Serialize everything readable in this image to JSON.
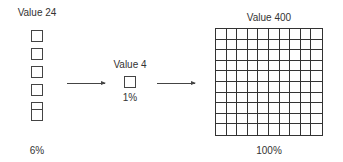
{
  "diagram": {
    "left": {
      "title": "Value 24",
      "percent": "6%",
      "squares": 6
    },
    "middle": {
      "title": "Value 4",
      "percent": "1%",
      "squares": 1
    },
    "right": {
      "title": "Value 400",
      "percent": "100%",
      "grid_rows": 10,
      "grid_cols": 10
    },
    "arrows": [
      {
        "from": "left",
        "to": "middle"
      },
      {
        "from": "middle",
        "to": "right"
      }
    ]
  },
  "colors": {
    "stroke": "#333333",
    "text": "#333333",
    "background": "#ffffff"
  }
}
